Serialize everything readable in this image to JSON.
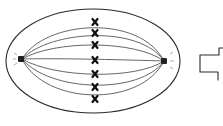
{
  "diagram": {
    "description": "Hand-drawn cell in metaphase: spindle fibers between two centrioles, chromosomes aligned at the equatorial plate, with a block arrow pointing right",
    "colors": {
      "ink": "#2a2a2a",
      "fiber": "#555555",
      "chromosome": "#111111",
      "background": "#ffffff"
    },
    "cell": {
      "cx": 93,
      "cy": 61,
      "rx": 87,
      "ry": 52
    },
    "centrioles": [
      {
        "side": "left",
        "x": 22,
        "y": 59
      },
      {
        "side": "right",
        "x": 164,
        "y": 61
      }
    ],
    "chromosomes": [
      {
        "x": 95,
        "y": 22
      },
      {
        "x": 95,
        "y": 33
      },
      {
        "x": 95,
        "y": 45
      },
      {
        "x": 95,
        "y": 60
      },
      {
        "x": 95,
        "y": 74
      },
      {
        "x": 95,
        "y": 87
      },
      {
        "x": 95,
        "y": 99
      }
    ],
    "spindle_fiber_count": 7,
    "arrow": {
      "direction": "right",
      "label": ""
    }
  }
}
